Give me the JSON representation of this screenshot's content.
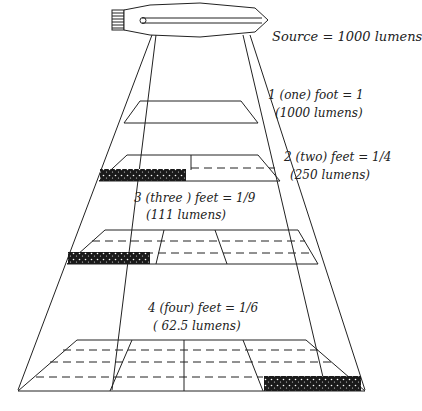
{
  "diagram": {
    "source": {
      "label": "Source = 1000 lumens",
      "icon": "light-bulb-icon"
    },
    "planes": [
      {
        "distance_label": "1 (one) foot = 1",
        "lumens_label": "(1000 lumens)"
      },
      {
        "distance_label": "2 (two) feet = 1/4",
        "lumens_label": "(250 lumens)"
      },
      {
        "distance_label": "3 (three ) feet = 1/9",
        "lumens_label": "(111 lumens)"
      },
      {
        "distance_label": "4 (four) feet = 1/6",
        "lumens_label": "( 62.5 lumens)"
      }
    ],
    "colors": {
      "line": "#222222",
      "background": "#ffffff"
    }
  }
}
